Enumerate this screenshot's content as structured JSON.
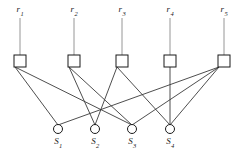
{
  "diagram": {
    "type": "bipartite-graph",
    "colors": {
      "background": "#ffffff",
      "node_stroke": "#1a1a1a",
      "node_fill": "#ffffff",
      "edge": "#3a3a3a",
      "stem": "#8a8a8a",
      "label": "#1a1a1a"
    },
    "top_nodes": [
      {
        "id": "r1",
        "base": "r",
        "sub": "1",
        "label": "r1",
        "x": 20,
        "y": 61,
        "label_x": 20,
        "label_y": 9,
        "stem_top": 18,
        "stem_bottom": 55,
        "shape": "square",
        "size": 12
      },
      {
        "id": "r2",
        "base": "r",
        "sub": "2",
        "label": "r2",
        "x": 74,
        "y": 61,
        "label_x": 74,
        "label_y": 9,
        "stem_top": 18,
        "stem_bottom": 55,
        "shape": "square",
        "size": 12
      },
      {
        "id": "r3",
        "base": "r",
        "sub": "3",
        "label": "r3",
        "x": 122,
        "y": 61,
        "label_x": 122,
        "label_y": 9,
        "stem_top": 18,
        "stem_bottom": 55,
        "shape": "square",
        "size": 12
      },
      {
        "id": "r4",
        "base": "r",
        "sub": "4",
        "label": "r4",
        "x": 170,
        "y": 61,
        "label_x": 170,
        "label_y": 9,
        "stem_top": 18,
        "stem_bottom": 55,
        "shape": "square",
        "size": 12
      },
      {
        "id": "r5",
        "base": "r",
        "sub": "5",
        "label": "r5",
        "x": 224,
        "y": 61,
        "label_x": 224,
        "label_y": 9,
        "stem_top": 18,
        "stem_bottom": 55,
        "shape": "square",
        "size": 12
      }
    ],
    "bottom_nodes": [
      {
        "id": "s1",
        "base": "S",
        "sub": "1",
        "label": "S1",
        "x": 58,
        "y": 129,
        "label_x": 58,
        "label_y": 138,
        "shape": "circle",
        "radius": 4.5
      },
      {
        "id": "s2",
        "base": "S",
        "sub": "2",
        "label": "S2",
        "x": 95,
        "y": 129,
        "label_x": 95,
        "label_y": 138,
        "shape": "circle",
        "radius": 4.5
      },
      {
        "id": "s3",
        "base": "S",
        "sub": "3",
        "label": "S3",
        "x": 132,
        "y": 129,
        "label_x": 132,
        "label_y": 138,
        "shape": "circle",
        "radius": 4.5
      },
      {
        "id": "s4",
        "base": "S",
        "sub": "4",
        "label": "S4",
        "x": 170,
        "y": 129,
        "label_x": 170,
        "label_y": 138,
        "shape": "circle",
        "radius": 4.5
      }
    ],
    "edges": [
      {
        "from": "r1",
        "to": "s1",
        "x1": 15,
        "y1": 67,
        "x2": 58,
        "y2": 125
      },
      {
        "from": "r1",
        "to": "s3",
        "x1": 15,
        "y1": 67,
        "x2": 132,
        "y2": 125
      },
      {
        "from": "r2",
        "to": "s2",
        "x1": 69,
        "y1": 67,
        "x2": 95,
        "y2": 125
      },
      {
        "from": "r2",
        "to": "s3",
        "x1": 69,
        "y1": 67,
        "x2": 132,
        "y2": 125
      },
      {
        "from": "r3",
        "to": "s2",
        "x1": 117,
        "y1": 67,
        "x2": 95,
        "y2": 125
      },
      {
        "from": "r3",
        "to": "s4",
        "x1": 117,
        "y1": 67,
        "x2": 170,
        "y2": 125
      },
      {
        "from": "r4",
        "to": "s4",
        "x1": 170,
        "y1": 67,
        "x2": 170,
        "y2": 125
      },
      {
        "from": "r5",
        "to": "s1",
        "x1": 219,
        "y1": 67,
        "x2": 58,
        "y2": 125
      },
      {
        "from": "r5",
        "to": "s3",
        "x1": 219,
        "y1": 67,
        "x2": 132,
        "y2": 125
      },
      {
        "from": "r5",
        "to": "s4",
        "x1": 219,
        "y1": 67,
        "x2": 170,
        "y2": 125
      }
    ]
  }
}
